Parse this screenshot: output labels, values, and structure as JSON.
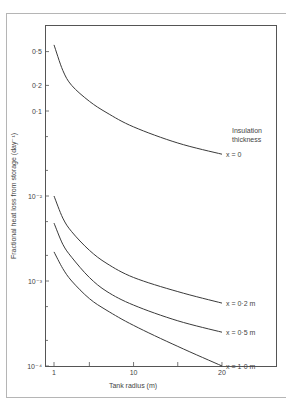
{
  "chart_data": {
    "type": "line",
    "title": "",
    "xlabel": "Tank radius (m)",
    "ylabel": "Fractional heat loss from storage (day⁻¹)",
    "xscale": "linear",
    "yscale": "log",
    "xlim": [
      0,
      23
    ],
    "ylim": [
      0.0001,
      1
    ],
    "x_ticks": [
      1,
      5,
      10,
      15,
      20
    ],
    "x_tick_labels": [
      "1",
      "",
      "10",
      "",
      "20"
    ],
    "y_ticks": [
      0.0001,
      0.0002,
      0.0005,
      0.001,
      0.002,
      0.005,
      0.01,
      0.02,
      0.05,
      0.1,
      0.2,
      0.5
    ],
    "y_tick_labels": [
      "10⁻⁴",
      "",
      "",
      "10⁻³",
      "",
      "",
      "10⁻²",
      "",
      "",
      "0·1",
      "0·2",
      "0·5"
    ],
    "grid": false,
    "legend_title": "Insulation thickness",
    "legend_position": "inline-right",
    "series": [
      {
        "name": "x = 0",
        "label": "x = 0",
        "x": [
          1,
          2,
          3,
          5,
          7,
          10,
          15,
          20
        ],
        "values": [
          0.6,
          0.3,
          0.2,
          0.13,
          0.095,
          0.065,
          0.042,
          0.031
        ]
      },
      {
        "name": "x = 0.2 m",
        "label": "x = 0·2 m",
        "x": [
          1,
          2,
          3,
          5,
          7,
          10,
          15,
          20
        ],
        "values": [
          0.01,
          0.0055,
          0.0038,
          0.0023,
          0.0016,
          0.0011,
          0.00075,
          0.00055
        ]
      },
      {
        "name": "x = 0.5 m",
        "label": "x = 0·5 m",
        "x": [
          1,
          2,
          3,
          5,
          7,
          10,
          15,
          20
        ],
        "values": [
          0.0048,
          0.0027,
          0.0019,
          0.0011,
          0.00075,
          0.00052,
          0.00034,
          0.00025
        ]
      },
      {
        "name": "x = 1.0 m",
        "label": "x = 1·0 m",
        "x": [
          1,
          2,
          3,
          5,
          7,
          10,
          15,
          20
        ],
        "values": [
          0.0022,
          0.0014,
          0.001,
          0.00062,
          0.00045,
          0.0003,
          0.00017,
          0.0001
        ]
      }
    ]
  },
  "layout": {
    "plot": {
      "left": 45,
      "top": 25,
      "right": 277,
      "bottom": 366
    },
    "x_px_per_unit": 8.84,
    "x_origin_px": 54,
    "x_origin_val": 1,
    "y_px_per_decade": 85,
    "line_color": "#3a3a3a",
    "frame_color": "#9a9a9a"
  }
}
